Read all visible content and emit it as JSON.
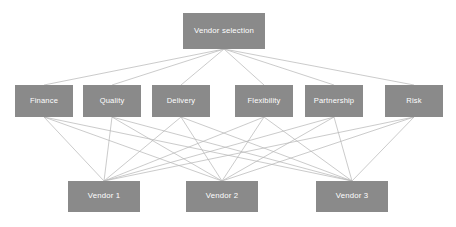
{
  "diagram": {
    "type": "hierarchy-network",
    "colors": {
      "node_fill": "#8a8a8a",
      "node_text": "#ffffff",
      "edge_line": "#b5b5b5",
      "background": "#ffffff"
    },
    "levels": [
      {
        "name": "goal",
        "nodes": [
          {
            "id": "goal",
            "label": "Vendor selection",
            "x": 183,
            "y": 13,
            "w": 82,
            "h": 36
          }
        ]
      },
      {
        "name": "criteria",
        "nodes": [
          {
            "id": "c1",
            "label": "Finance",
            "x": 15,
            "y": 85,
            "w": 58,
            "h": 32
          },
          {
            "id": "c2",
            "label": "Quality",
            "x": 83,
            "y": 85,
            "w": 58,
            "h": 32
          },
          {
            "id": "c3",
            "label": "Delivery",
            "x": 152,
            "y": 85,
            "w": 58,
            "h": 32
          },
          {
            "id": "c4",
            "label": "Flexibility",
            "x": 235,
            "y": 85,
            "w": 58,
            "h": 32
          },
          {
            "id": "c5",
            "label": "Partnership",
            "x": 305,
            "y": 85,
            "w": 58,
            "h": 32
          },
          {
            "id": "c6",
            "label": "Risk",
            "x": 385,
            "y": 85,
            "w": 58,
            "h": 32
          }
        ]
      },
      {
        "name": "alternatives",
        "nodes": [
          {
            "id": "a1",
            "label": "Vendor 1",
            "x": 68,
            "y": 181,
            "w": 72,
            "h": 31
          },
          {
            "id": "a2",
            "label": "Vendor 2",
            "x": 186,
            "y": 181,
            "w": 72,
            "h": 31
          },
          {
            "id": "a3",
            "label": "Vendor 3",
            "x": 316,
            "y": 181,
            "w": 72,
            "h": 31
          }
        ]
      }
    ],
    "edges": {
      "goal_to_criteria": [
        {
          "from": "goal",
          "to": "c1"
        },
        {
          "from": "goal",
          "to": "c2"
        },
        {
          "from": "goal",
          "to": "c3"
        },
        {
          "from": "goal",
          "to": "c4"
        },
        {
          "from": "goal",
          "to": "c5"
        },
        {
          "from": "goal",
          "to": "c6"
        }
      ],
      "criteria_to_alternatives": [
        {
          "from": "c1",
          "to": "a1"
        },
        {
          "from": "c1",
          "to": "a2"
        },
        {
          "from": "c1",
          "to": "a3"
        },
        {
          "from": "c2",
          "to": "a1"
        },
        {
          "from": "c2",
          "to": "a2"
        },
        {
          "from": "c2",
          "to": "a3"
        },
        {
          "from": "c3",
          "to": "a1"
        },
        {
          "from": "c3",
          "to": "a2"
        },
        {
          "from": "c3",
          "to": "a3"
        },
        {
          "from": "c4",
          "to": "a1"
        },
        {
          "from": "c4",
          "to": "a2"
        },
        {
          "from": "c4",
          "to": "a3"
        },
        {
          "from": "c5",
          "to": "a1"
        },
        {
          "from": "c5",
          "to": "a2"
        },
        {
          "from": "c5",
          "to": "a3"
        },
        {
          "from": "c6",
          "to": "a1"
        },
        {
          "from": "c6",
          "to": "a2"
        },
        {
          "from": "c6",
          "to": "a3"
        }
      ]
    }
  }
}
